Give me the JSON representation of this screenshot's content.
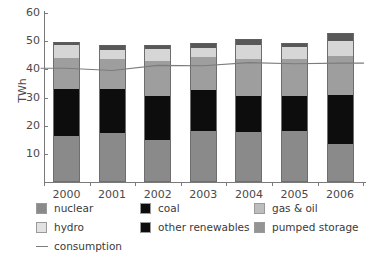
{
  "chart_data": {
    "type": "bar",
    "stacked": true,
    "title": "",
    "xlabel": "",
    "ylabel": "TWh",
    "ylim": [
      0,
      60
    ],
    "yticks": [
      10,
      20,
      30,
      40,
      50,
      60
    ],
    "grid": false,
    "legend_position": "bottom",
    "categories": [
      "2000",
      "2001",
      "2002",
      "2003",
      "2004",
      "2005",
      "2006"
    ],
    "series": [
      {
        "name": "nuclear",
        "color": "#8a8a8a",
        "values": [
          16.4,
          17.5,
          15.0,
          18.0,
          17.6,
          18.1,
          13.6
        ]
      },
      {
        "name": "other renewables",
        "color": "#0d0d0d",
        "values": [
          3.5,
          2.5,
          4.2,
          2.2,
          2.6,
          2.3,
          6.4
        ]
      },
      {
        "name": "coal",
        "color": "#0d0d0d",
        "values": [
          13.2,
          13.1,
          11.2,
          12.3,
          10.5,
          10.1,
          11.0
        ]
      },
      {
        "name": "gas & oil",
        "color": "#9e9e9e",
        "values": [
          10.9,
          10.6,
          12.6,
          12.0,
          12.9,
          13.2,
          13.9
        ]
      },
      {
        "name": "hydro",
        "color": "#d6d6d6",
        "values": [
          4.6,
          3.3,
          4.2,
          3.0,
          5.2,
          4.4,
          5.0
        ]
      },
      {
        "name": "pumped storage",
        "color": "#585858",
        "values": [
          1.1,
          1.5,
          1.6,
          1.7,
          1.8,
          1.3,
          2.9
        ]
      }
    ],
    "line_series": {
      "name": "consumption",
      "color": "#7c7c7c",
      "values": [
        40.4,
        39.6,
        41.4,
        41.3,
        42.4,
        42.0,
        42.2
      ]
    }
  },
  "axes": {
    "y_title": "TWh",
    "y_tick_labels": [
      "60",
      "50",
      "40",
      "30",
      "20",
      "10"
    ],
    "x_tick_labels": [
      "2000",
      "2001",
      "2002",
      "2003",
      "2004",
      "2005",
      "2006"
    ]
  },
  "legend": {
    "items": [
      {
        "label": "nuclear",
        "swatch": "#8a8a8a",
        "type": "swatch"
      },
      {
        "label": "coal",
        "swatch": "#0d0d0d",
        "type": "swatch"
      },
      {
        "label": "gas & oil",
        "swatch": "#bdbdbd",
        "type": "swatch"
      },
      {
        "label": "hydro",
        "swatch": "#e2e2e2",
        "type": "swatch"
      },
      {
        "label": "other renewables",
        "swatch": "#0d0d0d",
        "type": "swatch"
      },
      {
        "label": "pumped storage",
        "swatch": "#949494",
        "type": "swatch"
      },
      {
        "label": "consumption",
        "swatch": "#7c7c7c",
        "type": "line"
      }
    ]
  }
}
